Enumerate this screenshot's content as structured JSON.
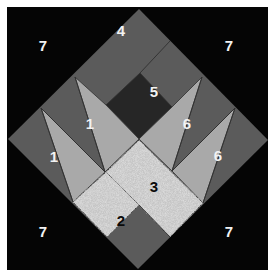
{
  "diagram": {
    "type": "quilt-block-piece-map",
    "colors": {
      "background": "#050505",
      "medium": "#5b5b5b",
      "light": "#a9a9a9",
      "dark": "#262626",
      "speckled": "#c6c6c6",
      "seam": "#303030"
    },
    "labels": [
      {
        "id": "7-top-left",
        "text": "7",
        "style": "light"
      },
      {
        "id": "7-top-right",
        "text": "7",
        "style": "light"
      },
      {
        "id": "7-bottom-left",
        "text": "7",
        "style": "light"
      },
      {
        "id": "7-bottom-right",
        "text": "7",
        "style": "light"
      },
      {
        "id": "4",
        "text": "4",
        "style": "light"
      },
      {
        "id": "5",
        "text": "5",
        "style": "light"
      },
      {
        "id": "1-upper",
        "text": "1",
        "style": "light"
      },
      {
        "id": "1-lower",
        "text": "1",
        "style": "light"
      },
      {
        "id": "6-upper",
        "text": "6",
        "style": "light"
      },
      {
        "id": "6-lower",
        "text": "6",
        "style": "light"
      },
      {
        "id": "3",
        "text": "3",
        "style": "dark"
      },
      {
        "id": "2",
        "text": "2",
        "style": "dark"
      }
    ]
  }
}
